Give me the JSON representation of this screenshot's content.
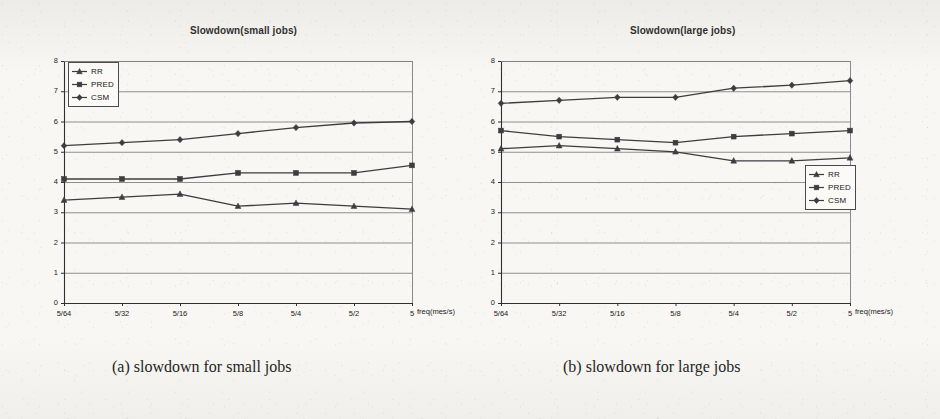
{
  "figure": {
    "panels": [
      {
        "title": "Slowdown(small jobs)",
        "caption": "(a) slowdown for small jobs",
        "legend_position": "top-left"
      },
      {
        "title": "Slowdown(large jobs)",
        "caption": "(b) slowdown for large jobs",
        "legend_position": "middle-right"
      }
    ],
    "legend_labels": [
      "RR",
      "PRED",
      "CSM"
    ],
    "xaxis_label": "freq(mes/s)",
    "series_markers": [
      "triangle",
      "square",
      "diamond"
    ],
    "line_color": "#3d3d40",
    "grid_color": "#7d7d80",
    "axis_color": "#2f2f32"
  },
  "chart_data": [
    {
      "type": "line",
      "title": "Slowdown(small jobs)",
      "xlabel": "freq(mes/s)",
      "ylabel": "",
      "categories": [
        "5/64",
        "5/32",
        "5/16",
        "5/8",
        "5/4",
        "5/2",
        "5"
      ],
      "ylim": [
        0,
        8
      ],
      "yticks": [
        0,
        1,
        2,
        3,
        4,
        5,
        6,
        7,
        8
      ],
      "grid": true,
      "legend_position": "upper left",
      "series": [
        {
          "name": "RR",
          "marker": "triangle",
          "values": [
            3.4,
            3.5,
            3.6,
            3.2,
            3.3,
            3.2,
            3.1
          ]
        },
        {
          "name": "PRED",
          "marker": "square",
          "values": [
            4.1,
            4.1,
            4.1,
            4.3,
            4.3,
            4.3,
            4.55
          ]
        },
        {
          "name": "CSM",
          "marker": "diamond",
          "values": [
            5.2,
            5.3,
            5.4,
            5.6,
            5.8,
            5.95,
            6.0
          ]
        }
      ]
    },
    {
      "type": "line",
      "title": "Slowdown(large jobs)",
      "xlabel": "freq(mes/s)",
      "ylabel": "",
      "categories": [
        "5/64",
        "5/32",
        "5/16",
        "5/8",
        "5/4",
        "5/2",
        "5"
      ],
      "ylim": [
        0,
        8
      ],
      "yticks": [
        0,
        1,
        2,
        3,
        4,
        5,
        6,
        7,
        8
      ],
      "grid": true,
      "legend_position": "center right",
      "series": [
        {
          "name": "RR",
          "marker": "triangle",
          "values": [
            5.1,
            5.2,
            5.1,
            5.0,
            4.7,
            4.7,
            4.8
          ]
        },
        {
          "name": "PRED",
          "marker": "square",
          "values": [
            5.7,
            5.5,
            5.4,
            5.3,
            5.5,
            5.6,
            5.7
          ]
        },
        {
          "name": "CSM",
          "marker": "diamond",
          "values": [
            6.6,
            6.7,
            6.8,
            6.8,
            7.1,
            7.2,
            7.35
          ]
        }
      ]
    }
  ]
}
